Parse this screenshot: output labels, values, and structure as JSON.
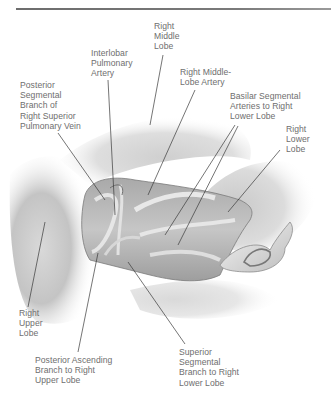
{
  "figure": {
    "type": "anatomical-illustration",
    "colors": {
      "rule": "#6d6d6d",
      "label_text": "#6e6e6e",
      "leader_line": "#3a3a3a"
    }
  },
  "labels": [
    {
      "id": "right-middle-lobe",
      "text": "Right\nMiddle\nLobe",
      "x": 154,
      "y": 21
    },
    {
      "id": "interlobar-pulmonary-artery",
      "text": "Interlobar\nPulmonary\nArtery",
      "x": 91,
      "y": 48
    },
    {
      "id": "right-middle-lobe-artery",
      "text": "Right Middle-\nLobe Artery",
      "x": 180,
      "y": 67
    },
    {
      "id": "posterior-segmental-branch-vein",
      "text": "Posterior\nSegmental\nBranch of\nRight Superior\nPulmonary Vein",
      "x": 20,
      "y": 80
    },
    {
      "id": "basilar-segmental-arteries",
      "text": "Basilar Segmental\nArteries to Right\nLower Lobe",
      "x": 230,
      "y": 91
    },
    {
      "id": "right-lower-lobe",
      "text": "Right\nLower\nLobe",
      "x": 286,
      "y": 124
    },
    {
      "id": "right-upper-lobe",
      "text": "Right\nUpper\nLobe",
      "x": 19,
      "y": 308
    },
    {
      "id": "posterior-ascending-branch",
      "text": "Posterior Ascending\nBranch to Right\nUpper Lobe",
      "x": 35,
      "y": 355
    },
    {
      "id": "superior-segmental-branch",
      "text": "Superior\nSegmental\nBranch to Right\nLower Lobe",
      "x": 179,
      "y": 347
    }
  ]
}
